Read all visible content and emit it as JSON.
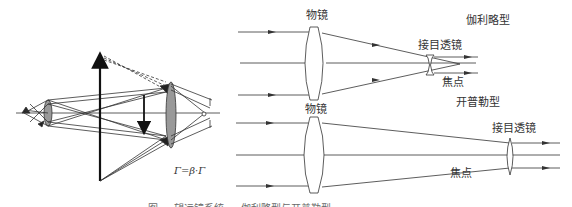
{
  "figure": {
    "left_panel": {
      "name": "compound-magnification-diagram",
      "formula": "Γ=β·Γ"
    },
    "galilean": {
      "type_label": "伽利略型",
      "objective_label": "物镜",
      "eyepiece_label": "接目透镜",
      "focus_label": "焦点"
    },
    "keplerian": {
      "type_label": "开普勒型",
      "objective_label": "物镜",
      "eyepiece_label": "接目透镜",
      "focus_label": "焦点"
    },
    "caption": "图 … 望远镜系统 … 伽利略型与开普勒型"
  },
  "colors": {
    "line": "#333333",
    "lens_fill": "#999999",
    "background": "#ffffff"
  }
}
